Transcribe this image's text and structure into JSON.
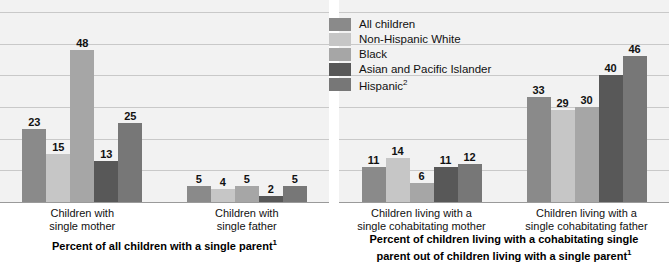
{
  "legend": {
    "items": [
      {
        "label": "All children",
        "color": "#8a8a8a"
      },
      {
        "label": "Non-Hispanic White",
        "color": "#c6c6c6"
      },
      {
        "label": "Black",
        "color": "#a6a6a6"
      },
      {
        "label": "Asian and Pacific Islander",
        "color": "#585858"
      },
      {
        "label": "Hispanic",
        "color": "#777777",
        "superscript": "2"
      }
    ]
  },
  "panels": [
    {
      "caption": "Percent of all children with a single parent",
      "caption_superscript": "1",
      "categories": [
        "Children with\nsingle mother",
        "Children with\nsingle father"
      ]
    },
    {
      "caption": "Percent of children living with a cohabitating single\nparent out of children living with a single parent",
      "caption_superscript": "1",
      "categories": [
        "Children living with a\nsingle cohabitating mother",
        "Children living with a\nsingle cohabitating father"
      ]
    }
  ],
  "chart_data": {
    "type": "bar",
    "title": "",
    "xlabel": "",
    "ylabel": "",
    "ylim": [
      0,
      60
    ],
    "grid": true,
    "gridline_interval": 10,
    "legend_position": "top-center",
    "categories": [
      "Children with single mother",
      "Children with single father",
      "Children living with a single cohabitating mother",
      "Children living with a single cohabitating father"
    ],
    "series": [
      {
        "name": "All children",
        "color": "#8a8a8a",
        "values": [
          23,
          5,
          11,
          33
        ]
      },
      {
        "name": "Non-Hispanic White",
        "color": "#c6c6c6",
        "values": [
          15,
          4,
          14,
          29
        ]
      },
      {
        "name": "Black",
        "color": "#a6a6a6",
        "values": [
          48,
          5,
          6,
          30
        ]
      },
      {
        "name": "Asian and Pacific Islander",
        "color": "#585858",
        "values": [
          13,
          2,
          11,
          40
        ]
      },
      {
        "name": "Hispanic2",
        "color": "#777777",
        "values": [
          25,
          5,
          12,
          46
        ]
      }
    ],
    "panel_captions": [
      "Percent of all children with a single parent1",
      "Percent of children living with a cohabitating single parent out of children living with a single parent1"
    ]
  }
}
